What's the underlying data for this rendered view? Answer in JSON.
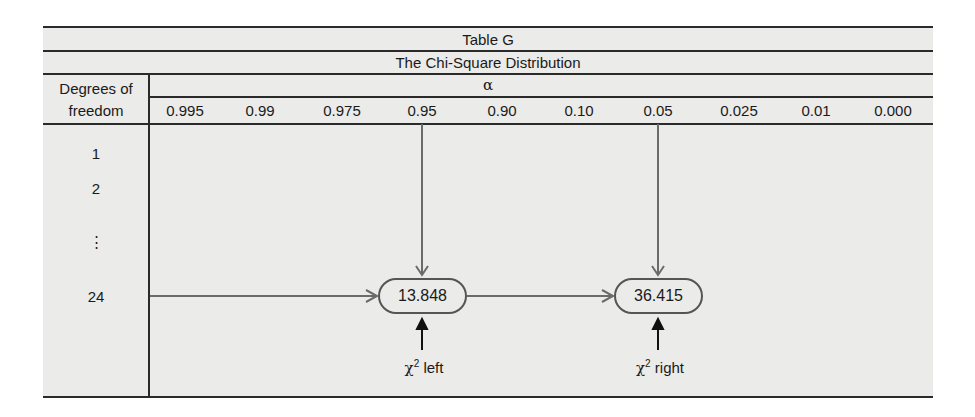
{
  "table": {
    "title": "Table G",
    "subtitle": "The Chi-Square Distribution",
    "row_header_line1": "Degrees of",
    "row_header_line2": "freedom",
    "alpha_symbol": "α",
    "alpha_columns": [
      "0.995",
      "0.99",
      "0.975",
      "0.95",
      "0.90",
      "0.10",
      "0.05",
      "0.025",
      "0.01",
      "0.000"
    ],
    "rows": [
      "1",
      "2",
      "⋮",
      "24"
    ],
    "values": {
      "left": "13.848",
      "right": "36.415"
    },
    "labels": {
      "left_chi": "χ",
      "left_sup": "2",
      "left_text": " left",
      "right_chi": "χ",
      "right_sup": "2",
      "right_text": " right"
    }
  },
  "colors": {
    "background": "#ebebe9",
    "rule": "#2a2a2a",
    "arrow_gray": "#6b6b6b",
    "arrow_black": "#111111"
  }
}
